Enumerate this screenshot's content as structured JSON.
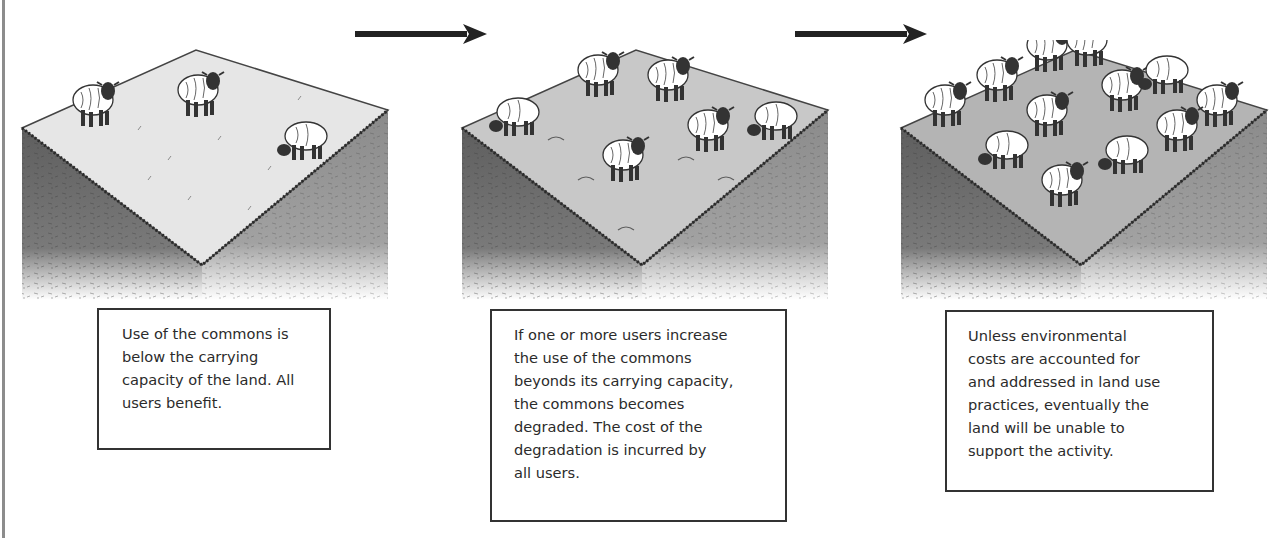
{
  "stages": [
    {
      "id": "stage-1",
      "sheep_count": 3,
      "ground": "light, grassy",
      "caption": "Use of the commons is\nbelow the carrying\ncapacity of the land. All\nusers benefit."
    },
    {
      "id": "stage-2",
      "sheep_count": 7,
      "ground": "partially degraded",
      "caption": "If one or more users increase\nthe use of the commons\nbeyonds its carrying capacity,\nthe commons becomes\ndegraded. The cost of the\ndegradation is incurred by\nall users."
    },
    {
      "id": "stage-3",
      "sheep_count": 14,
      "ground": "bare, overgrazed",
      "caption": "Unless environmental\ncosts are accounted for\nand addressed in land use\npractices, eventually the\nland will be unable to\nsupport the activity."
    }
  ],
  "arrows": [
    "arrow-right",
    "arrow-right"
  ],
  "colors": {
    "ink": "#2b2b2b",
    "soil_dark": "#6f6f6f",
    "soil_light": "#9a9a9a",
    "top_light": "#e6e6e6",
    "top_mid": "#c8c8c8",
    "top_dark": "#b4b4b4",
    "rule": "#8c8c8c"
  }
}
